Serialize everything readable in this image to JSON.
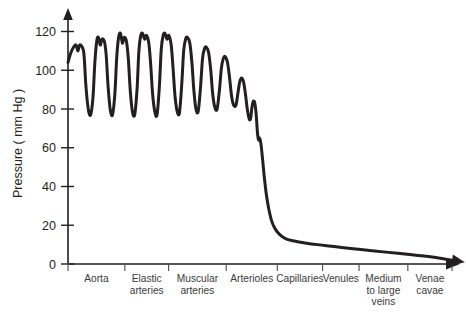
{
  "chart_data": {
    "type": "line",
    "title": "",
    "subtitle": "",
    "xlabel": "",
    "ylabel": "Pressure ( mm Hg )",
    "ylim": [
      0,
      128
    ],
    "xlim": [
      0,
      100
    ],
    "grid": false,
    "legend": null,
    "yticks": [
      0,
      20,
      40,
      60,
      80,
      100,
      120
    ],
    "ytick_labels": [
      "0",
      "20",
      "40",
      "60",
      "80",
      "100",
      "120"
    ],
    "categories": [
      "Aorta",
      "Elastic arteries",
      "Muscular arteries",
      "Arterioles",
      "Capillaries",
      "Venules",
      "Medium to large veins",
      "Venae cavae"
    ],
    "category_label_lines": [
      [
        "Aorta"
      ],
      [
        "Elastic",
        "arteries"
      ],
      [
        "Muscular",
        "arteries"
      ],
      [
        "Arterioles"
      ],
      [
        "Capillaries"
      ],
      [
        "Venules"
      ],
      [
        "Medium",
        "to large",
        "veins"
      ],
      [
        "Venae",
        "cavae"
      ]
    ],
    "category_boundaries_pct": [
      0,
      14.8,
      26.2,
      41.2,
      54.5,
      66.3,
      75.8,
      88.5,
      100
    ],
    "axis_arrows": {
      "y_axis_arrow": true,
      "x_axis_arrow": true,
      "curve_end_arrow": true
    },
    "annotations": [],
    "series": [
      {
        "name": "Blood pressure",
        "color": "#231f20",
        "systolic_mmHg": 118,
        "diastolic_mmHg": 77,
        "pulse_count": 9,
        "points": [
          {
            "x": 0.0,
            "y": 104
          },
          {
            "x": 1.2,
            "y": 109
          },
          {
            "x": 2.4,
            "y": 112
          },
          {
            "x": 3.4,
            "y": 113
          },
          {
            "x": 4.2,
            "y": 110
          },
          {
            "x": 4.9,
            "y": 113
          },
          {
            "x": 6.0,
            "y": 112
          },
          {
            "x": 6.8,
            "y": 108
          },
          {
            "x": 7.6,
            "y": 92
          },
          {
            "x": 8.6,
            "y": 80
          },
          {
            "x": 9.6,
            "y": 77
          },
          {
            "x": 10.6,
            "y": 86
          },
          {
            "x": 11.4,
            "y": 104
          },
          {
            "x": 12.2,
            "y": 115
          },
          {
            "x": 12.9,
            "y": 117
          },
          {
            "x": 13.7,
            "y": 113
          },
          {
            "x": 14.4,
            "y": 116
          },
          {
            "x": 15.4,
            "y": 115
          },
          {
            "x": 16.2,
            "y": 108
          },
          {
            "x": 17.0,
            "y": 92
          },
          {
            "x": 17.9,
            "y": 80
          },
          {
            "x": 18.9,
            "y": 77
          },
          {
            "x": 19.9,
            "y": 88
          },
          {
            "x": 20.7,
            "y": 107
          },
          {
            "x": 21.5,
            "y": 117
          },
          {
            "x": 22.3,
            "y": 119
          },
          {
            "x": 23.1,
            "y": 114
          },
          {
            "x": 23.8,
            "y": 117
          },
          {
            "x": 24.8,
            "y": 115
          },
          {
            "x": 25.6,
            "y": 106
          },
          {
            "x": 26.4,
            "y": 90
          },
          {
            "x": 27.3,
            "y": 79
          },
          {
            "x": 28.3,
            "y": 77
          },
          {
            "x": 29.3,
            "y": 90
          },
          {
            "x": 30.1,
            "y": 110
          },
          {
            "x": 30.9,
            "y": 118
          },
          {
            "x": 31.7,
            "y": 119
          },
          {
            "x": 32.5,
            "y": 116
          },
          {
            "x": 33.3,
            "y": 118
          },
          {
            "x": 34.3,
            "y": 114
          },
          {
            "x": 35.1,
            "y": 103
          },
          {
            "x": 35.9,
            "y": 88
          },
          {
            "x": 36.8,
            "y": 79
          },
          {
            "x": 37.8,
            "y": 77
          },
          {
            "x": 38.8,
            "y": 92
          },
          {
            "x": 39.6,
            "y": 111
          },
          {
            "x": 40.4,
            "y": 118
          },
          {
            "x": 41.2,
            "y": 119
          },
          {
            "x": 42.0,
            "y": 116
          },
          {
            "x": 42.8,
            "y": 118
          },
          {
            "x": 43.8,
            "y": 113
          },
          {
            "x": 44.6,
            "y": 101
          },
          {
            "x": 45.4,
            "y": 87
          },
          {
            "x": 46.3,
            "y": 79
          },
          {
            "x": 47.3,
            "y": 78
          },
          {
            "x": 48.3,
            "y": 93
          },
          {
            "x": 49.1,
            "y": 110
          },
          {
            "x": 49.9,
            "y": 116
          },
          {
            "x": 50.7,
            "y": 117
          },
          {
            "x": 51.7,
            "y": 114
          },
          {
            "x": 52.6,
            "y": 104
          },
          {
            "x": 53.4,
            "y": 90
          },
          {
            "x": 54.3,
            "y": 80
          },
          {
            "x": 55.3,
            "y": 79
          },
          {
            "x": 56.3,
            "y": 92
          },
          {
            "x": 57.1,
            "y": 106
          },
          {
            "x": 57.9,
            "y": 111
          },
          {
            "x": 58.7,
            "y": 112
          },
          {
            "x": 59.7,
            "y": 109
          },
          {
            "x": 60.6,
            "y": 100
          },
          {
            "x": 61.4,
            "y": 88
          },
          {
            "x": 62.3,
            "y": 81
          },
          {
            "x": 63.3,
            "y": 80
          },
          {
            "x": 64.3,
            "y": 90
          },
          {
            "x": 65.1,
            "y": 101
          },
          {
            "x": 65.9,
            "y": 106
          },
          {
            "x": 66.7,
            "y": 107
          },
          {
            "x": 67.7,
            "y": 104
          },
          {
            "x": 68.6,
            "y": 96
          },
          {
            "x": 69.4,
            "y": 87
          },
          {
            "x": 70.3,
            "y": 82
          },
          {
            "x": 71.3,
            "y": 82
          },
          {
            "x": 72.1,
            "y": 88
          },
          {
            "x": 72.9,
            "y": 94
          },
          {
            "x": 73.7,
            "y": 96
          },
          {
            "x": 74.5,
            "y": 94
          },
          {
            "x": 75.3,
            "y": 88
          },
          {
            "x": 76.1,
            "y": 80
          },
          {
            "x": 76.9,
            "y": 75
          },
          {
            "x": 77.5,
            "y": 75
          },
          {
            "x": 78.1,
            "y": 81
          },
          {
            "x": 78.7,
            "y": 84
          },
          {
            "x": 79.3,
            "y": 83
          },
          {
            "x": 79.9,
            "y": 77
          },
          {
            "x": 80.4,
            "y": 68
          },
          {
            "x": 80.9,
            "y": 64
          },
          {
            "x": 81.3,
            "y": 65
          },
          {
            "x": 81.9,
            "y": 62
          },
          {
            "x": 82.6,
            "y": 54
          },
          {
            "x": 83.4,
            "y": 44
          },
          {
            "x": 84.3,
            "y": 35
          },
          {
            "x": 85.3,
            "y": 28
          },
          {
            "x": 86.5,
            "y": 22
          },
          {
            "x": 88.0,
            "y": 18
          },
          {
            "x": 90.0,
            "y": 15
          },
          {
            "x": 92.5,
            "y": 13
          },
          {
            "x": 95.5,
            "y": 12
          },
          {
            "x": 100.0,
            "y": 11
          },
          {
            "x": 106.0,
            "y": 10
          },
          {
            "x": 113.0,
            "y": 9
          },
          {
            "x": 120.0,
            "y": 8
          },
          {
            "x": 128.0,
            "y": 7
          },
          {
            "x": 136.0,
            "y": 6
          },
          {
            "x": 144.0,
            "y": 5
          },
          {
            "x": 152.0,
            "y": 4
          },
          {
            "x": 158.0,
            "y": 3
          },
          {
            "x": 163.0,
            "y": 2
          }
        ]
      }
    ]
  }
}
